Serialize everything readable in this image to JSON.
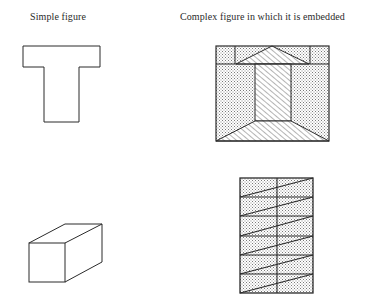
{
  "headers": {
    "simple": "Simple figure",
    "complex": "Complex figure in which it is embedded"
  },
  "rows": [
    {
      "simple_figure": {
        "shape": "T-shape",
        "icon": "t-shape-icon"
      },
      "complex_figure": {
        "shape": "shaded square with embedded T (top band with triangle, central hatched stem, hatched trapezoid base)",
        "icon": "embedded-t-figure-icon"
      }
    },
    {
      "simple_figure": {
        "shape": "rectangular prism (box)",
        "icon": "box-shape-icon"
      },
      "complex_figure": {
        "shape": "shaded rectangle split into two columns and six rows with diagonals",
        "icon": "embedded-box-figure-icon"
      }
    }
  ],
  "colors": {
    "stroke": "#2b2b2b",
    "stipple": "#9a9a9a",
    "background": "#ffffff"
  }
}
